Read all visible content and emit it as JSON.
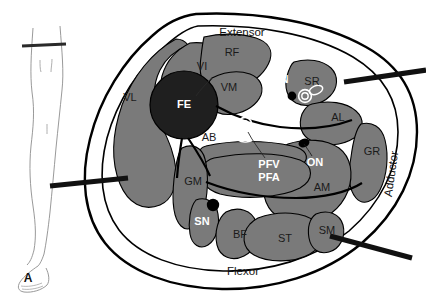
{
  "figure": {
    "panel_letter": "A",
    "colors": {
      "muscle_fill": "#7a7a7a",
      "bone_fill": "#1f1f1f",
      "fascia_fill": "#ffffff",
      "outline": "#000000",
      "needle": "#111111",
      "label_dark": "#1a1a1a",
      "label_light": "#ffffff",
      "vessel_outline": "#ffffff",
      "nerve_dot": "#000000",
      "leg_line": "#8a8a8a"
    },
    "compartments": [
      {
        "id": "extensor",
        "label": "Extensor",
        "x": 242,
        "y": 33,
        "rotate": 0
      },
      {
        "id": "flexor",
        "label": "Flexor",
        "x": 243,
        "y": 272,
        "rotate": 0
      },
      {
        "id": "adductor",
        "label": "Adductor",
        "x": 392,
        "y": 174,
        "rotate": -82
      }
    ],
    "muscles": [
      {
        "id": "vl",
        "label": "VL",
        "x": 130,
        "y": 98,
        "style": "dark"
      },
      {
        "id": "vi",
        "label": "VI",
        "x": 202,
        "y": 67,
        "style": "dark"
      },
      {
        "id": "vm",
        "label": "VM",
        "x": 229,
        "y": 88,
        "style": "dark"
      },
      {
        "id": "rf",
        "label": "RF",
        "x": 232,
        "y": 53,
        "style": "dark"
      },
      {
        "id": "sr",
        "label": "SR",
        "x": 312,
        "y": 82,
        "style": "dark"
      },
      {
        "id": "al",
        "label": "AL",
        "x": 338,
        "y": 118,
        "style": "dark"
      },
      {
        "id": "gr",
        "label": "GR",
        "x": 372,
        "y": 152,
        "style": "dark"
      },
      {
        "id": "am",
        "label": "AM",
        "x": 322,
        "y": 188,
        "style": "dark"
      },
      {
        "id": "ab",
        "label": "AB",
        "x": 209,
        "y": 138,
        "style": "dark"
      },
      {
        "id": "gm",
        "label": "GM",
        "x": 193,
        "y": 182,
        "style": "dark"
      },
      {
        "id": "bf",
        "label": "BF",
        "x": 240,
        "y": 235,
        "style": "dark"
      },
      {
        "id": "st",
        "label": "ST",
        "x": 285,
        "y": 239,
        "style": "dark"
      },
      {
        "id": "sm",
        "label": "SM",
        "x": 327,
        "y": 231,
        "style": "dark"
      }
    ],
    "bone": {
      "id": "fe",
      "label": "FE",
      "x": 184,
      "y": 105
    },
    "neurovascular": [
      {
        "id": "fv",
        "label": "FV",
        "x": 281,
        "y": 54,
        "style": "light"
      },
      {
        "id": "fa",
        "label": "FA",
        "x": 281,
        "y": 67,
        "style": "light"
      },
      {
        "id": "fn",
        "label": "FN",
        "x": 281,
        "y": 80,
        "style": "light"
      },
      {
        "id": "pfv",
        "label": "PFV",
        "x": 269,
        "y": 165,
        "style": "light"
      },
      {
        "id": "pfa",
        "label": "PFA",
        "x": 269,
        "y": 178,
        "style": "light"
      },
      {
        "id": "on",
        "label": "ON",
        "x": 315,
        "y": 163,
        "style": "light"
      },
      {
        "id": "sn",
        "label": "SN",
        "x": 202,
        "y": 222,
        "style": "light"
      }
    ],
    "needles": [
      {
        "id": "needle-lateral",
        "label": "lateral-approach-needle"
      },
      {
        "id": "needle-anterior",
        "label": "anterior-approach-needle"
      },
      {
        "id": "needle-posterior",
        "label": "posterior-approach-needle"
      }
    ],
    "leg_inset": {
      "id": "leg-diagram",
      "label": "leg-silhouette",
      "section_marker": "section-level-bar"
    }
  }
}
